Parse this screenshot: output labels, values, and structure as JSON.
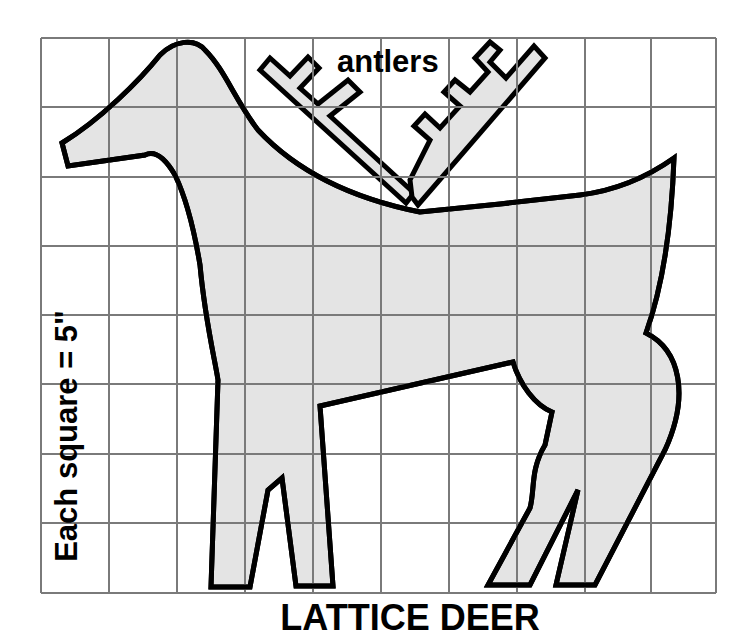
{
  "diagram": {
    "title": "LATTICE DEER",
    "scale_note": "Each square = 5\"",
    "callouts": {
      "antlers": "antlers"
    },
    "grid": {
      "columns": 10,
      "rows": 8,
      "square_size_label": "5\"",
      "line_color": "#7a7a7a"
    },
    "colors": {
      "fill": "#e4e4e4",
      "outline": "#000000",
      "background": "#ffffff"
    },
    "parts": [
      "head",
      "neck",
      "body",
      "tail",
      "front-legs",
      "hind-legs",
      "antlers"
    ]
  }
}
